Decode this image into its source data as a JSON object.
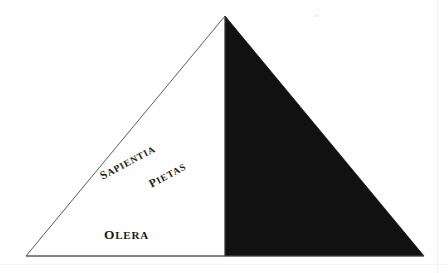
{
  "figure": {
    "type": "triangle-diagram",
    "background_color": "#fefefe",
    "outline_color": "#4a4a4a",
    "fill_color": "#111111",
    "baseline_color": "#555555",
    "geometry": {
      "apex": {
        "x": 225,
        "y": 16
      },
      "bottom_left": {
        "x": 26,
        "y": 256
      },
      "bottom_right": {
        "x": 424,
        "y": 256
      },
      "divider_x": 225,
      "shaded_half": "right"
    },
    "labels": [
      {
        "id": "sapientia",
        "text": "SAPIENTIA",
        "first_letter": "S",
        "rest": "APIENTIA",
        "rotation_deg": -28,
        "x": 101,
        "y": 171
      },
      {
        "id": "pietas",
        "text": "PIETAS",
        "first_letter": "P",
        "rest": "IETAS",
        "rotation_deg": -28,
        "x": 150,
        "y": 179
      },
      {
        "id": "olera",
        "text": "OLERA",
        "first_letter": "O",
        "rest": "LERA",
        "rotation_deg": 0,
        "x": 104,
        "y": 228
      }
    ]
  }
}
